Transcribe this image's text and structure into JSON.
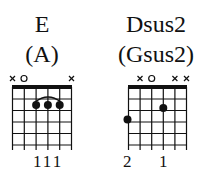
{
  "chords": [
    {
      "name": "E",
      "alt_name": "(A)",
      "string_markers": [
        "x",
        "o",
        "",
        "",
        "",
        "x"
      ],
      "dots": [
        {
          "string": 3,
          "fret": 2
        },
        {
          "string": 4,
          "fret": 2
        },
        {
          "string": 5,
          "fret": 2
        }
      ],
      "barre_arc": {
        "from_string": 3,
        "to_string": 5,
        "fret": 2
      },
      "finger_labels": [
        "",
        "",
        "1",
        "1",
        "1",
        ""
      ],
      "finger_text": "111"
    },
    {
      "name": "Dsus2",
      "alt_name": "(Gsus2)",
      "string_markers": [
        "",
        "x",
        "o",
        "",
        "x",
        "x"
      ],
      "dots": [
        {
          "string": 1,
          "fret": 3
        },
        {
          "string": 4,
          "fret": 2
        }
      ],
      "finger_labels": [
        "2",
        "",
        "",
        "1",
        "",
        ""
      ],
      "finger_text_left": "2",
      "finger_text_right": "1"
    }
  ]
}
